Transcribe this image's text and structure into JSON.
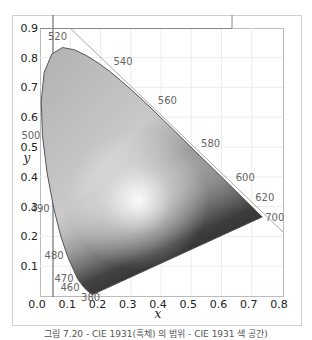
{
  "caption": "그림 7.20 - CIE 1931(흑체) 의 범위 - CIE 1931 색 공간)",
  "chart_data": {
    "type": "scatter",
    "xlabel": "x",
    "ylabel": "y",
    "xlim": [
      0.0,
      0.8
    ],
    "ylim": [
      0.0,
      0.9
    ],
    "grid": true,
    "x_ticks": [
      "0.0",
      "0.1",
      "0.2",
      "0.3",
      "0.4",
      "0.5",
      "0.6",
      "0.7",
      "0.8"
    ],
    "y_ticks": [
      "0.1",
      "0.2",
      "0.3",
      "0.4",
      "0.5",
      "0.6",
      "0.7",
      "0.8",
      "0.9"
    ],
    "spectral_locus_labels": [
      {
        "nm": "380",
        "x": 0.1741,
        "y": 0.005
      },
      {
        "nm": "460",
        "x": 0.144,
        "y": 0.0297
      },
      {
        "nm": "470",
        "x": 0.1241,
        "y": 0.0578
      },
      {
        "nm": "480",
        "x": 0.0913,
        "y": 0.1327
      },
      {
        "nm": "490",
        "x": 0.0454,
        "y": 0.295
      },
      {
        "nm": "500",
        "x": 0.0082,
        "y": 0.5384
      },
      {
        "nm": "520",
        "x": 0.0743,
        "y": 0.8338
      },
      {
        "nm": "540",
        "x": 0.2296,
        "y": 0.7543
      },
      {
        "nm": "560",
        "x": 0.3731,
        "y": 0.6245
      },
      {
        "nm": "580",
        "x": 0.5125,
        "y": 0.4866
      },
      {
        "nm": "600",
        "x": 0.627,
        "y": 0.3725
      },
      {
        "nm": "620",
        "x": 0.6915,
        "y": 0.3083
      },
      {
        "nm": "700",
        "x": 0.7347,
        "y": 0.2653
      }
    ],
    "locus": [
      [
        0.1741,
        0.005
      ],
      [
        0.1738,
        0.0049
      ],
      [
        0.1736,
        0.0049
      ],
      [
        0.1733,
        0.0048
      ],
      [
        0.1726,
        0.0048
      ],
      [
        0.1714,
        0.0051
      ],
      [
        0.1689,
        0.0069
      ],
      [
        0.1644,
        0.0109
      ],
      [
        0.1566,
        0.0177
      ],
      [
        0.144,
        0.0297
      ],
      [
        0.1241,
        0.0578
      ],
      [
        0.0913,
        0.1327
      ],
      [
        0.0687,
        0.2007
      ],
      [
        0.0454,
        0.295
      ],
      [
        0.0235,
        0.4127
      ],
      [
        0.0082,
        0.5384
      ],
      [
        0.0039,
        0.6548
      ],
      [
        0.0139,
        0.7502
      ],
      [
        0.0389,
        0.812
      ],
      [
        0.0743,
        0.8338
      ],
      [
        0.1142,
        0.8262
      ],
      [
        0.1547,
        0.8059
      ],
      [
        0.1929,
        0.7816
      ],
      [
        0.2296,
        0.7543
      ],
      [
        0.2658,
        0.7243
      ],
      [
        0.3016,
        0.6923
      ],
      [
        0.3373,
        0.6589
      ],
      [
        0.3731,
        0.6245
      ],
      [
        0.4087,
        0.5896
      ],
      [
        0.4441,
        0.5547
      ],
      [
        0.4788,
        0.5202
      ],
      [
        0.5125,
        0.4866
      ],
      [
        0.5448,
        0.4544
      ],
      [
        0.5752,
        0.4242
      ],
      [
        0.6029,
        0.3965
      ],
      [
        0.627,
        0.3725
      ],
      [
        0.6482,
        0.3514
      ],
      [
        0.6658,
        0.334
      ],
      [
        0.6801,
        0.3197
      ],
      [
        0.6915,
        0.3083
      ],
      [
        0.7006,
        0.2993
      ],
      [
        0.7079,
        0.292
      ],
      [
        0.714,
        0.2859
      ],
      [
        0.719,
        0.2809
      ],
      [
        0.723,
        0.277
      ],
      [
        0.726,
        0.274
      ],
      [
        0.7283,
        0.2717
      ],
      [
        0.73,
        0.27
      ],
      [
        0.7311,
        0.2689
      ],
      [
        0.732,
        0.268
      ],
      [
        0.7327,
        0.2673
      ],
      [
        0.7334,
        0.2666
      ],
      [
        0.734,
        0.266
      ],
      [
        0.7344,
        0.2656
      ],
      [
        0.7346,
        0.2654
      ],
      [
        0.7347,
        0.2653
      ]
    ]
  }
}
